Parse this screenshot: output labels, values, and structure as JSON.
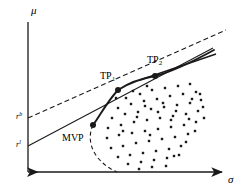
{
  "figure": {
    "width": 248,
    "height": 196,
    "background": "#ffffff",
    "ink_color": "#1a1a1a"
  },
  "axes": {
    "y_label": "μ",
    "x_label": "σ",
    "origin": {
      "x": 28,
      "y": 172
    },
    "y_top": {
      "x": 28,
      "y": 22
    },
    "x_right": {
      "x": 222,
      "y": 172
    },
    "arrowheads": true
  },
  "rate_ticks": [
    {
      "name": "borrowing-rate",
      "label_base": "r",
      "label_sup": "b",
      "y": 118,
      "x": 16
    },
    {
      "name": "lending-rate",
      "label_base": "r",
      "label_sup": "l",
      "y": 146,
      "x": 16
    }
  ],
  "points": [
    {
      "name": "MVP",
      "label": "MVP",
      "x": 93,
      "y": 125,
      "label_x": 62,
      "label_y": 133
    },
    {
      "name": "TP1",
      "label": "TP",
      "sub": "1",
      "x": 118,
      "y": 90,
      "label_x": 100,
      "label_y": 71
    },
    {
      "name": "TP2",
      "label": "TP",
      "sub": "2",
      "x": 155,
      "y": 76,
      "label_x": 147,
      "label_y": 55
    }
  ],
  "curves": {
    "frontier_efficient": {
      "name": "efficient-frontier-solid",
      "style": "solid",
      "path": "M 93 125 C 100 116 106 103 118 90 C 130 82 144 78 155 76 C 172 72 192 62 214 50"
    },
    "frontier_inefficient": {
      "name": "inefficient-frontier-dashed",
      "style": "dashed",
      "path": "M 93 125 C 88 136 90 148 98 158 C 104 165 110 169 117 172"
    },
    "lending_line": {
      "name": "lending-capital-line-solid",
      "style": "solid",
      "from": {
        "x": 28,
        "y": 146
      },
      "to": {
        "x": 213,
        "y": 48
      }
    },
    "borrowing_line": {
      "name": "borrowing-capital-line-dashed",
      "style": "dashed",
      "from": {
        "x": 28,
        "y": 118
      },
      "to": {
        "x": 226,
        "y": 30
      }
    },
    "tangent_segment": {
      "name": "tangent-segment-solid",
      "style": "solid",
      "from": {
        "x": 140,
        "y": 80
      },
      "to": {
        "x": 216,
        "y": 54
      }
    }
  },
  "asset_cloud": {
    "name": "asset-scatter-cloud",
    "marker": "square",
    "marker_size": 2.4,
    "count": 78,
    "points": [
      [
        126,
        98
      ],
      [
        140,
        94
      ],
      [
        152,
        90
      ],
      [
        165,
        88
      ],
      [
        178,
        86
      ],
      [
        190,
        84
      ],
      [
        118,
        108
      ],
      [
        131,
        104
      ],
      [
        144,
        101
      ],
      [
        157,
        99
      ],
      [
        170,
        96
      ],
      [
        183,
        94
      ],
      [
        196,
        92
      ],
      [
        112,
        118
      ],
      [
        125,
        114
      ],
      [
        138,
        112
      ],
      [
        151,
        109
      ],
      [
        164,
        107
      ],
      [
        177,
        105
      ],
      [
        190,
        103
      ],
      [
        201,
        100
      ],
      [
        108,
        128
      ],
      [
        121,
        125
      ],
      [
        134,
        122
      ],
      [
        147,
        120
      ],
      [
        160,
        118
      ],
      [
        173,
        116
      ],
      [
        186,
        114
      ],
      [
        198,
        111
      ],
      [
        107,
        138
      ],
      [
        119,
        135
      ],
      [
        132,
        133
      ],
      [
        145,
        131
      ],
      [
        158,
        129
      ],
      [
        171,
        127
      ],
      [
        184,
        125
      ],
      [
        196,
        122
      ],
      [
        111,
        148
      ],
      [
        123,
        146
      ],
      [
        136,
        143
      ],
      [
        149,
        141
      ],
      [
        162,
        139
      ],
      [
        175,
        137
      ],
      [
        188,
        134
      ],
      [
        118,
        157
      ],
      [
        130,
        155
      ],
      [
        143,
        153
      ],
      [
        156,
        151
      ],
      [
        169,
        149
      ],
      [
        181,
        146
      ],
      [
        128,
        164
      ],
      [
        141,
        162
      ],
      [
        154,
        160
      ],
      [
        167,
        158
      ],
      [
        179,
        155
      ],
      [
        145,
        106
      ],
      [
        158,
        112
      ],
      [
        171,
        120
      ],
      [
        133,
        91
      ],
      [
        147,
        86
      ],
      [
        192,
        99
      ],
      [
        203,
        107
      ],
      [
        195,
        131
      ],
      [
        186,
        142
      ],
      [
        174,
        156
      ],
      [
        116,
        98
      ],
      [
        123,
        131
      ],
      [
        137,
        117
      ],
      [
        150,
        135
      ],
      [
        163,
        103
      ],
      [
        176,
        111
      ],
      [
        189,
        119
      ],
      [
        200,
        94
      ],
      [
        166,
        166
      ],
      [
        152,
        167
      ],
      [
        139,
        169
      ],
      [
        204,
        118
      ]
    ]
  }
}
